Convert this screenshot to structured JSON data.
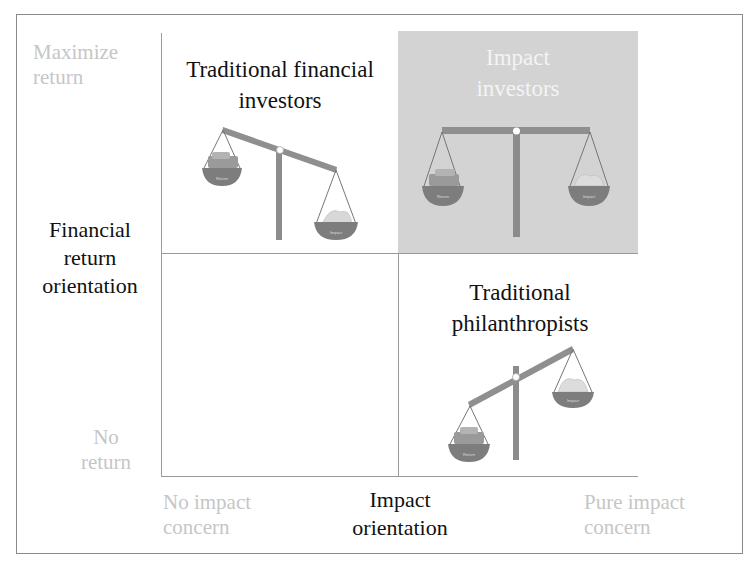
{
  "diagram": {
    "y_axis": {
      "title": "Financial return orientation",
      "title_lines": [
        "Financial",
        "return",
        "orientation"
      ],
      "top_label_lines": [
        "Maximize",
        "return"
      ],
      "bottom_label_lines": [
        "No",
        "return"
      ]
    },
    "x_axis": {
      "title_lines": [
        "Impact",
        "orientation"
      ],
      "left_label_lines": [
        "No impact",
        "concern"
      ],
      "right_label_lines": [
        "Pure impact",
        "concern"
      ]
    },
    "quadrants": [
      {
        "id": "top-left",
        "title_lines": [
          "Traditional financial",
          "investors"
        ],
        "scale_tilt": "return-heavy",
        "pan_labels": [
          "Return",
          "Impact"
        ],
        "highlighted": false
      },
      {
        "id": "top-right",
        "title_lines": [
          "Impact",
          "investors"
        ],
        "scale_tilt": "balanced",
        "pan_labels": [
          "Return",
          "Impact"
        ],
        "highlighted": true
      },
      {
        "id": "bottom-right",
        "title_lines": [
          "Traditional",
          "philanthropists"
        ],
        "scale_tilt": "return-heavy-low",
        "pan_labels": [
          "Return",
          "Impact"
        ],
        "highlighted": false
      },
      {
        "id": "bottom-left",
        "title_lines": [],
        "highlighted": false
      }
    ],
    "colors": {
      "highlight_fill": "#d3d3d3",
      "beam": "#8f8f8f",
      "pan": "#7d7d7d",
      "faint_text": "#c6c6c6",
      "grid_line": "#9a9a9a"
    }
  }
}
